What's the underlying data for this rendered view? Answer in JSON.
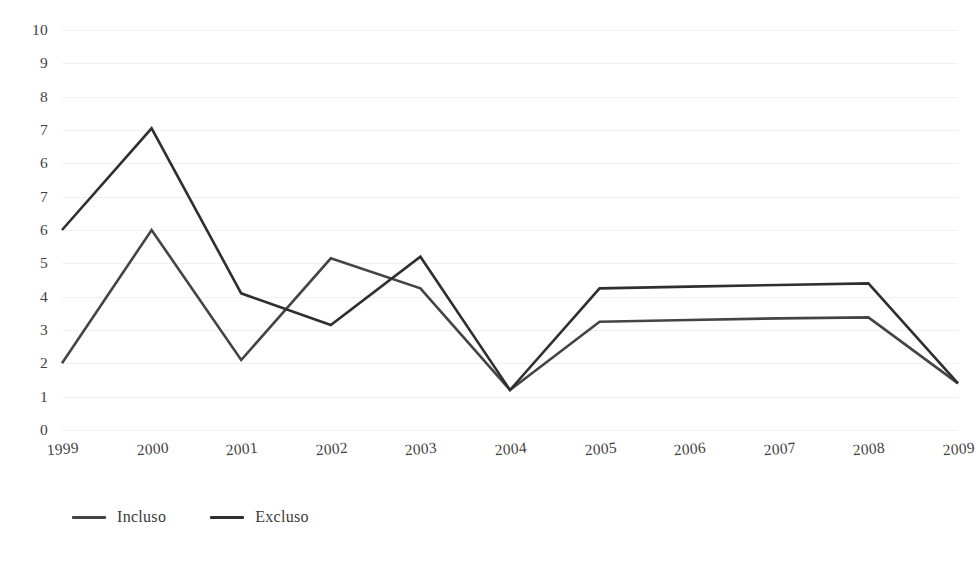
{
  "chart_data": {
    "type": "line",
    "title": "",
    "subtitle": "",
    "xlabel": "",
    "ylabel": "",
    "categories": [
      "1999",
      "2000",
      "2001",
      "2002",
      "2003",
      "2004",
      "2005",
      "2006",
      "2007",
      "2008",
      "2009"
    ],
    "y_tick_labels": [
      "10",
      "9",
      "8",
      "7",
      "6",
      "7",
      "6",
      "5",
      "4",
      "3",
      "2",
      "1",
      "0"
    ],
    "ylim": [
      0,
      12
    ],
    "grid": true,
    "legend_position": "bottom-left",
    "series": [
      {
        "name": "Incluso",
        "color": "#444444",
        "values": [
          2.0,
          6.0,
          2.1,
          5.15,
          4.25,
          1.2,
          3.25,
          3.3,
          3.35,
          3.38,
          1.4
        ]
      },
      {
        "name": "Excluso",
        "color": "#2f2f2f",
        "values": [
          6.0,
          9.05,
          4.1,
          3.15,
          5.2,
          1.2,
          4.25,
          4.3,
          4.35,
          4.4,
          1.4
        ]
      }
    ],
    "annotations": []
  },
  "legend": {
    "items": [
      {
        "label": "Incluso",
        "color": "#444444"
      },
      {
        "label": "Excluso",
        "color": "#2f2f2f"
      }
    ]
  }
}
